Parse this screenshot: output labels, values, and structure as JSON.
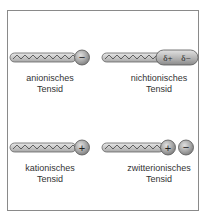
{
  "figure": {
    "panels": [
      {
        "id": "anionic",
        "label_line1": "anionisches",
        "label_line2": "Tensid",
        "head": [
          "−"
        ]
      },
      {
        "id": "nonionic",
        "label_line1": "nichtionisches",
        "label_line2": "Tensid",
        "head": [
          "δ+",
          "δ−"
        ]
      },
      {
        "id": "cationic",
        "label_line1": "kationisches",
        "label_line2": "Tensid",
        "head": [
          "+"
        ]
      },
      {
        "id": "zwitterionic",
        "label_line1": "zwitterionisches",
        "label_line2": "Tensid",
        "head": [
          "+",
          "−"
        ]
      }
    ],
    "colors": {
      "tail": "#c4c4c4",
      "head": "#9a9a9a",
      "outline": "#555555",
      "frame": "#8a8a8a"
    }
  }
}
